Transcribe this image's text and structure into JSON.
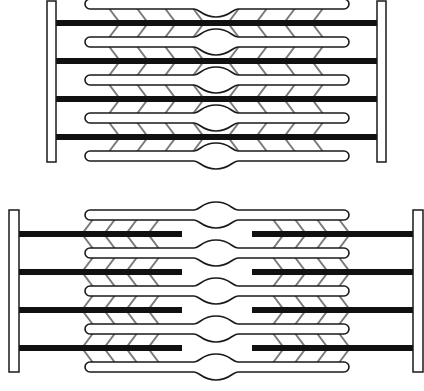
{
  "diagram": {
    "colors": {
      "background": "#ffffff",
      "outline": "#1a1a1a",
      "thick_bar": "#111111",
      "cross_bridge": "#7a7a7a"
    },
    "panels": [
      {
        "name": "sarcomere-top",
        "z_disc_left": {
          "x": 47,
          "y": 1,
          "w": 9,
          "h": 161
        },
        "z_disc_right": {
          "x": 377,
          "y": 1,
          "w": 9,
          "h": 161
        },
        "myosin_rows_y": [
          4,
          42,
          80,
          118,
          156
        ],
        "actin_rows_y": [
          23,
          61,
          99,
          137
        ],
        "myosin_x": [
          85,
          349
        ],
        "actin_segments": [
          [
            56,
            377
          ]
        ],
        "head_cx": 216,
        "bridge_left_x": [
          108,
          136,
          164,
          192
        ],
        "bridge_right_x": [
          240,
          268,
          296,
          324
        ],
        "bridge_dir_left": 1,
        "bridge_dir_right": -1
      },
      {
        "name": "sarcomere-bottom",
        "z_disc_left": {
          "x": 9,
          "y": 210,
          "w": 10,
          "h": 162
        },
        "z_disc_right": {
          "x": 413,
          "y": 210,
          "w": 10,
          "h": 162
        },
        "myosin_rows_y": [
          215,
          253,
          291,
          329,
          367
        ],
        "actin_rows_y": [
          234,
          272,
          310,
          348
        ],
        "myosin_x": [
          85,
          349
        ],
        "actin_segments": [
          [
            19,
            182
          ],
          [
            252,
            413
          ]
        ],
        "head_cx": 216,
        "bridge_left_x": [
          94,
          116,
          138,
          160
        ],
        "bridge_right_x": [
          272,
          294,
          316,
          338
        ],
        "bridge_dir_left": -1,
        "bridge_dir_right": 1
      }
    ]
  }
}
